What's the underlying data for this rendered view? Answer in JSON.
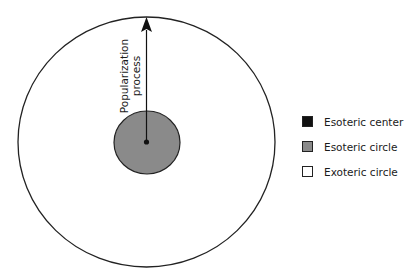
{
  "diagram": {
    "arrow_label_line1": "Popularization",
    "arrow_label_line2": "process",
    "colors": {
      "esoteric_center": "#111111",
      "esoteric_circle": "#8a8a8a",
      "exoteric_circle": "#ffffff",
      "stroke": "#222222"
    }
  },
  "legend": {
    "items": [
      {
        "label": "Esoteric center",
        "color": "#111111"
      },
      {
        "label": "Esoteric circle",
        "color": "#8a8a8a"
      },
      {
        "label": "Exoteric circle",
        "color": "#ffffff"
      }
    ]
  }
}
